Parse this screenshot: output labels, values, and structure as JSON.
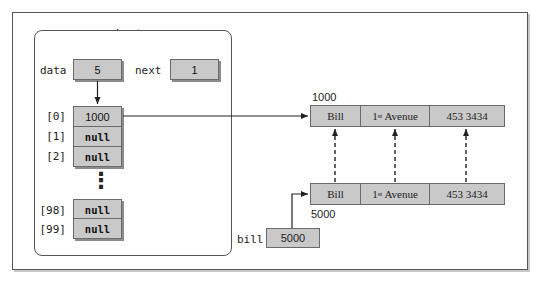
{
  "diagram": {
    "object_label": "boston",
    "fields": {
      "data": {
        "label": "data",
        "value": "5"
      },
      "next": {
        "label": "next",
        "value": "1"
      }
    },
    "array": [
      {
        "index": "[0]",
        "value": "1000"
      },
      {
        "index": "[1]",
        "value": "null"
      },
      {
        "index": "[2]",
        "value": "null"
      },
      {
        "index": "[98]",
        "value": "null"
      },
      {
        "index": "[99]",
        "value": "null"
      }
    ],
    "ellipsis": "⋮",
    "records": [
      {
        "address": "1000",
        "fields": {
          "name": "Bill",
          "street_num": "1",
          "street_sup": "st",
          "street_rest": " Avenue",
          "phone": "453 3434"
        }
      },
      {
        "address": "5000",
        "fields": {
          "name": "Bill",
          "street_num": "1",
          "street_sup": "st",
          "street_rest": " Avenue",
          "phone": "453 3434"
        }
      }
    ],
    "variable": {
      "label": "bill",
      "value": "5000"
    }
  }
}
